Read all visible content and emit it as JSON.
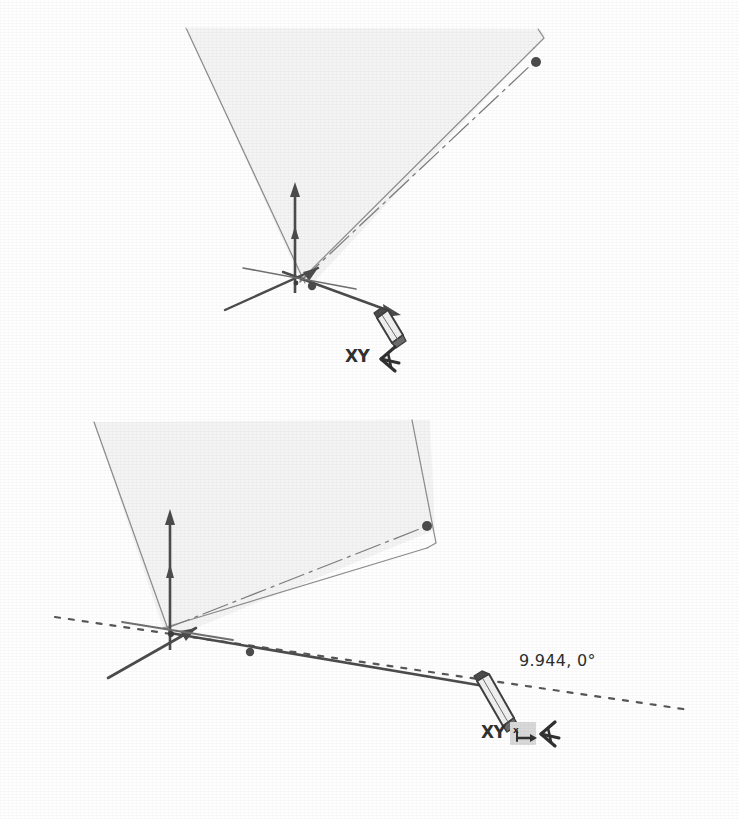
{
  "document": {
    "title": "Protractor tool — rotating the drawing axes",
    "background_color": "#ffffff",
    "ink_color": "#4a4a4a",
    "dark_ink_color": "#333333",
    "face_fill_color": "#f4f4f4",
    "highlight_color": "#d9d9d9"
  },
  "figures": [
    {
      "id": "figure-top",
      "name": "protractor-placed-on-origin",
      "caption_text": "",
      "cursor": {
        "icon": "pencil-cursor",
        "mode_label": "XY",
        "tool_icon": "protractor-icon",
        "badge_icon": null,
        "badge_label": ""
      },
      "measurement": {
        "visible": false,
        "value_text": ""
      },
      "entities": {
        "face_label": "shaded-face",
        "axis_origin_label": "axis-origin",
        "vertical_axis_label": "blue-axis-arrow",
        "right_axis_label": "red-axis-arrow",
        "left_axis_label": "green-axis-arrow",
        "dash_dot_line_label": "diagonal-edge-guide",
        "endpoint_dot_label": "endpoint-dot",
        "midpoint_dot_label": "midpoint-dot"
      }
    },
    {
      "id": "figure-bottom",
      "name": "protractor-rotating-axes",
      "caption_text": "",
      "cursor": {
        "icon": "pencil-cursor",
        "mode_label": "XY",
        "tool_icon": "protractor-icon",
        "badge_icon": "x-arrow-constraint-icon",
        "badge_label": "x"
      },
      "measurement": {
        "visible": true,
        "value_text": "9.944, 0°",
        "length": "9.944",
        "angle": "0°"
      },
      "entities": {
        "face_label": "shaded-face",
        "axis_origin_label": "axis-origin",
        "vertical_axis_label": "blue-axis-arrow",
        "right_axis_label": "red-axis-arrow",
        "left_axis_label": "green-axis-arrow",
        "dash_dot_line_label": "diagonal-edge-guide",
        "endpoint_dot_label": "endpoint-dot",
        "midpoint_dot_label": "midpoint-dot",
        "inference_line_label": "dotted-inference-line",
        "drag_line_label": "protractor-drag-line"
      }
    }
  ]
}
